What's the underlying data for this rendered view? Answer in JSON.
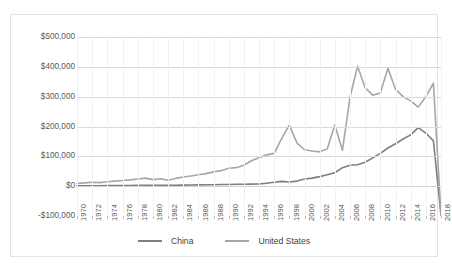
{
  "chart_data": {
    "type": "line",
    "title": "",
    "xlabel": "",
    "ylabel": "",
    "ylim": [
      -100000,
      500000
    ],
    "xlim": [
      1970,
      2018
    ],
    "grid": true,
    "legend_position": "bottom",
    "y_ticks": [
      "$500,000",
      "$400,000",
      "$300,000",
      "$200,000",
      "$100,000",
      "$0",
      "-$100,000"
    ],
    "y_tick_values": [
      500000,
      400000,
      300000,
      200000,
      100000,
      0,
      -100000
    ],
    "x_ticks": [
      "1970",
      "1972",
      "1974",
      "1976",
      "1978",
      "1980",
      "1982",
      "1984",
      "1986",
      "1988",
      "1990",
      "1992",
      "1994",
      "1996",
      "1998",
      "2000",
      "2002",
      "2004",
      "2006",
      "2008",
      "2010",
      "2012",
      "2014",
      "2016",
      "2018"
    ],
    "x": [
      1970,
      1971,
      1972,
      1973,
      1974,
      1975,
      1976,
      1977,
      1978,
      1979,
      1980,
      1981,
      1982,
      1983,
      1984,
      1985,
      1986,
      1987,
      1988,
      1989,
      1990,
      1991,
      1992,
      1993,
      1994,
      1995,
      1996,
      1997,
      1998,
      1999,
      2000,
      2001,
      2002,
      2003,
      2004,
      2005,
      2006,
      2007,
      2008,
      2009,
      2010,
      2011,
      2012,
      2013,
      2014,
      2015,
      2016,
      2017,
      2018
    ],
    "series": [
      {
        "name": "China",
        "color": "#7f7f7f",
        "values": [
          1000,
          1200,
          1400,
          1600,
          1800,
          2000,
          2200,
          2400,
          2600,
          2800,
          3000,
          3200,
          2800,
          3000,
          3400,
          3800,
          4200,
          4600,
          5000,
          5400,
          5800,
          6200,
          6600,
          7000,
          7500,
          10000,
          13000,
          16000,
          14000,
          17000,
          24000,
          27000,
          32000,
          38000,
          45000,
          62000,
          70000,
          72000,
          80000,
          95000,
          110000,
          128000,
          142000,
          158000,
          172000,
          196000,
          178000,
          152000,
          -98000
        ]
      },
      {
        "name": "United States",
        "color": "#a6a6a6",
        "values": [
          9000,
          11000,
          13000,
          12000,
          15000,
          17000,
          19000,
          21000,
          24000,
          27000,
          22000,
          25000,
          20000,
          26000,
          31000,
          34000,
          38000,
          42000,
          48000,
          52000,
          60000,
          62000,
          70000,
          85000,
          95000,
          105000,
          110000,
          160000,
          205000,
          145000,
          122000,
          118000,
          115000,
          125000,
          205000,
          120000,
          298000,
          402000,
          330000,
          305000,
          312000,
          395000,
          325000,
          300000,
          286000,
          265000,
          300000,
          345000,
          -98000
        ]
      }
    ]
  },
  "legend": {
    "items": [
      {
        "label": "China",
        "color": "#7f7f7f"
      },
      {
        "label": "United States",
        "color": "#a6a6a6"
      }
    ]
  }
}
